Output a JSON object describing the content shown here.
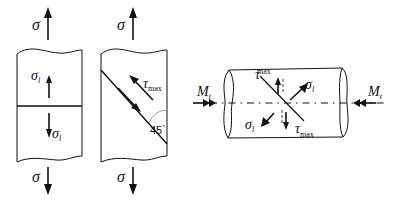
{
  "figure": {
    "panels": [
      {
        "id": "axial-section",
        "top_load": {
          "symbol": "σ"
        },
        "bottom_load": {
          "symbol": "σ"
        },
        "upper_stress": {
          "symbol": "σ",
          "subscript": "l"
        },
        "lower_stress": {
          "symbol": "σ",
          "subscript": "l"
        }
      },
      {
        "id": "inclined-section",
        "top_load": {
          "symbol": "σ"
        },
        "bottom_load": {
          "symbol": "σ"
        },
        "shear": {
          "symbol": "τ",
          "subscript": "max"
        },
        "angle_label": "45",
        "angle_unit": "°"
      },
      {
        "id": "torsion-cylinder",
        "left_moment": {
          "symbol": "M",
          "subscript": "t"
        },
        "right_moment": {
          "symbol": "M",
          "subscript": "t"
        },
        "shear_top": {
          "symbol": "τ",
          "subscript": "max"
        },
        "shear_bottom": {
          "symbol": "τ",
          "subscript": "max"
        },
        "stress_right": {
          "symbol": "σ",
          "subscript": "l"
        },
        "stress_left": {
          "symbol": "σ",
          "subscript": "l"
        }
      }
    ],
    "colors": {
      "ink": "#111111",
      "background": "#ffffff"
    }
  }
}
